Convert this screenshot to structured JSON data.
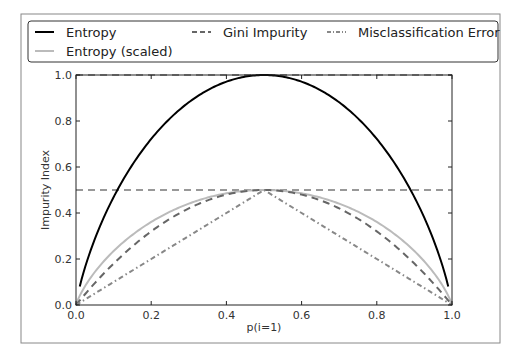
{
  "chart_data": {
    "type": "line",
    "title": "",
    "xlabel": "p(i=1)",
    "ylabel": "Impurity Index",
    "xlim": [
      0.0,
      1.0
    ],
    "ylim": [
      0.0,
      1.05
    ],
    "x_ticks": [
      "0.0",
      "0.2",
      "0.4",
      "0.6",
      "0.8",
      "1.0"
    ],
    "y_ticks": [
      "0.0",
      "0.2",
      "0.4",
      "0.6",
      "0.8",
      "1.0"
    ],
    "grid": false,
    "legend_position": "upper center (outside, above axes)",
    "legend_ncol": 3,
    "hlines": [
      {
        "y": 1.0,
        "style": "dashed",
        "color": "#333333"
      },
      {
        "y": 0.5,
        "style": "dashed",
        "color": "#333333"
      }
    ],
    "x": [
      0.01,
      0.05,
      0.1,
      0.15,
      0.2,
      0.25,
      0.3,
      0.35,
      0.4,
      0.45,
      0.5,
      0.55,
      0.6,
      0.65,
      0.7,
      0.75,
      0.8,
      0.85,
      0.9,
      0.95,
      0.99
    ],
    "series": [
      {
        "name": "Entropy",
        "style": "solid",
        "color": "#000000",
        "width": 2,
        "values": [
          0.081,
          0.286,
          0.469,
          0.61,
          0.722,
          0.811,
          0.881,
          0.934,
          0.971,
          0.993,
          1.0,
          0.993,
          0.971,
          0.934,
          0.881,
          0.811,
          0.722,
          0.61,
          0.469,
          0.286,
          0.081
        ]
      },
      {
        "name": "Entropy (scaled)",
        "style": "solid",
        "color": "#bbbbbb",
        "width": 2,
        "values": [
          0.04,
          0.143,
          0.234,
          0.305,
          0.361,
          0.406,
          0.441,
          0.467,
          0.485,
          0.496,
          0.5,
          0.496,
          0.485,
          0.467,
          0.441,
          0.406,
          0.361,
          0.305,
          0.234,
          0.143,
          0.04
        ]
      },
      {
        "name": "Gini Impurity",
        "style": "dashed",
        "color": "#666666",
        "width": 2,
        "values": [
          0.02,
          0.095,
          0.18,
          0.255,
          0.32,
          0.375,
          0.42,
          0.455,
          0.48,
          0.495,
          0.5,
          0.495,
          0.48,
          0.455,
          0.42,
          0.375,
          0.32,
          0.255,
          0.18,
          0.095,
          0.02
        ]
      },
      {
        "name": "Misclassification Error",
        "style": "dashdot",
        "color": "#888888",
        "width": 2,
        "values": [
          0.01,
          0.05,
          0.1,
          0.15,
          0.2,
          0.25,
          0.3,
          0.35,
          0.4,
          0.45,
          0.5,
          0.45,
          0.4,
          0.35,
          0.3,
          0.25,
          0.2,
          0.15,
          0.1,
          0.05,
          0.01
        ]
      }
    ]
  },
  "legend": {
    "entries": [
      "Entropy",
      "Gini Impurity",
      "Misclassification Error",
      "Entropy (scaled)"
    ]
  }
}
